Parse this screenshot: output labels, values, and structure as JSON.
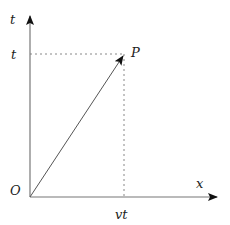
{
  "diagram": {
    "axes": {
      "vertical_label": "t",
      "horizontal_label": "x"
    },
    "origin_label": "O",
    "point_label": "P",
    "t_tick_label": "t",
    "x_tick_label": "vt",
    "colors": {
      "axis": "#777777",
      "vector": "#555555",
      "arrowhead": "#111111",
      "dashed": "#888888"
    }
  }
}
